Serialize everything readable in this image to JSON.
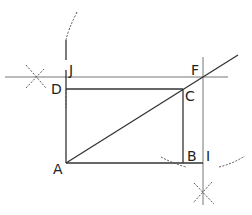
{
  "diagram": {
    "type": "geometric-construction",
    "points": {
      "A": {
        "label": "A",
        "x": 66,
        "y": 163
      },
      "B": {
        "label": "B",
        "x": 183,
        "y": 163
      },
      "C": {
        "label": "C",
        "x": 183,
        "y": 89
      },
      "D": {
        "label": "D",
        "x": 66,
        "y": 89
      },
      "F": {
        "label": "F",
        "x": 203,
        "y": 77
      },
      "I": {
        "label": "I",
        "x": 203,
        "y": 163
      },
      "J": {
        "label": "J",
        "x": 66,
        "y": 77
      }
    },
    "labels": {
      "A": "A",
      "B": "B",
      "C": "C",
      "D": "D",
      "F": "F",
      "I": "I",
      "J": "J"
    },
    "colors": {
      "line": "#333333",
      "construction": "#555555",
      "background": "#ffffff"
    }
  }
}
